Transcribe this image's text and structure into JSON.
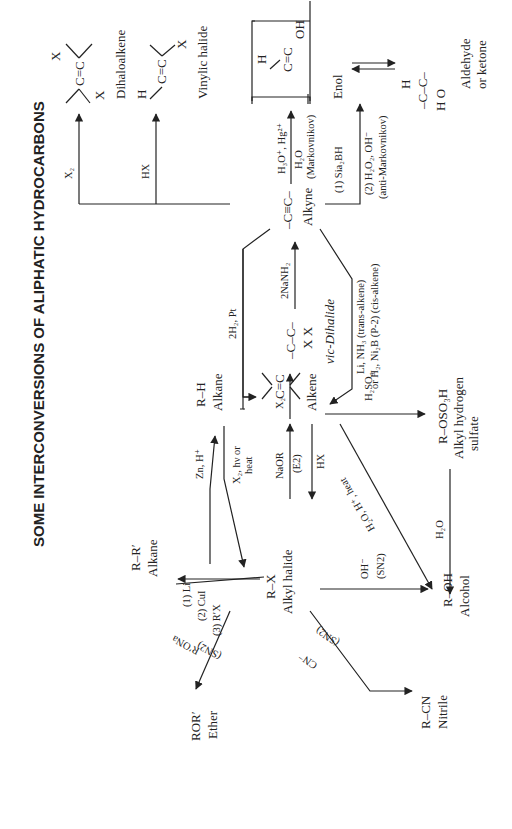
{
  "title": "SOME INTERCONVERSIONS OF ALIPHATIC HYDROCARBONS",
  "compounds": {
    "dihaloalkene": {
      "formula_top": "X",
      "formula": "C=C",
      "formula_bottom": "X",
      "label": "Dihaloalkene"
    },
    "vinylic_halide": {
      "formula_left": "H",
      "formula": "C=C",
      "formula_right": "X",
      "label": "Vinylic halide"
    },
    "enol": {
      "formula_left": "H",
      "formula": "C=C",
      "formula_right": "OH",
      "label": "Enol"
    },
    "carbonyl": {
      "top": "H",
      "formula": "–C–C–",
      "bottom": "H  O",
      "label_line1": "Aldehyde",
      "label_line2": "or ketone"
    },
    "alkyne": {
      "formula": "–C≡C–",
      "label": "Alkyne"
    },
    "vic_dihalide": {
      "formula": "–C–C–",
      "sub": "X X",
      "label": "vic-Dihalide"
    },
    "alkane_rh": {
      "formula": "R–H",
      "label": "Alkane"
    },
    "alkene": {
      "formula": "C=C",
      "label": "Alkene"
    },
    "alkyl_hydrogen_sulfate": {
      "formula": "R–OSO₃H",
      "label_line1": "Alkyl hydrogen",
      "label_line2": "sulfate"
    },
    "alkyl_halide": {
      "formula": "R–X",
      "label": "Alkyl halide"
    },
    "alkane_rr": {
      "formula": "R–R′",
      "label": "Alkane"
    },
    "alcohol": {
      "formula": "R–OH",
      "label": "Alcohol"
    },
    "ether": {
      "formula": "ROR′",
      "label": "Ether"
    },
    "nitrile": {
      "formula": "R–CN",
      "label": "Nitrile"
    }
  },
  "reagents": {
    "x2_to_dihaloalkene": "X₂",
    "hx_to_vinylic": "HX",
    "hydration_line1": "H₃O⁺, Hg²⁺",
    "hydration_line2": "H₂O",
    "hydration_line3": "(Markovnikov)",
    "hydroboration_line1": "(1) Sia₂BH",
    "hydroboration_line2": "(2) H₂O₂, OH⁻",
    "hydroboration_line3": "(anti-Markovnikov)",
    "alkyne_to_alkane": "2H₂, Pt",
    "dihalide_to_alkyne": "2NaNH₂",
    "alkene_to_dihalide": "X₂",
    "alkyne_to_alkene_line1": "Li, NH₃  (trans-alkene)",
    "alkyne_to_alkene_line2": "or H₂, Ni₂B (P-2) (cis-alkene)",
    "alkene_to_sulfate": "H₂SO₄",
    "sulfate_to_alcohol": "H₂O",
    "alkene_to_alcohol": "H₂O, H⁺, heat",
    "halide_to_alkane": "Zn, H⁺",
    "alkane_to_halide_line1": "X₂, hν or",
    "alkane_to_halide_line2": "heat",
    "halide_to_alkene_line1": "NaOR",
    "halide_to_alkene_line2": "(E2)",
    "alkene_to_halide": "HX",
    "coupling_line1": "(1) Li",
    "coupling_line2": "(2) CuI",
    "coupling_line3": "(3) R′X",
    "ether_line1": "R′ONa",
    "ether_line2": "(SN2)",
    "alcohol_line1": "OH⁻",
    "alcohol_line2": "(SN2)",
    "nitrile_line1": "CN⁻",
    "nitrile_line2": "(SN2)"
  }
}
